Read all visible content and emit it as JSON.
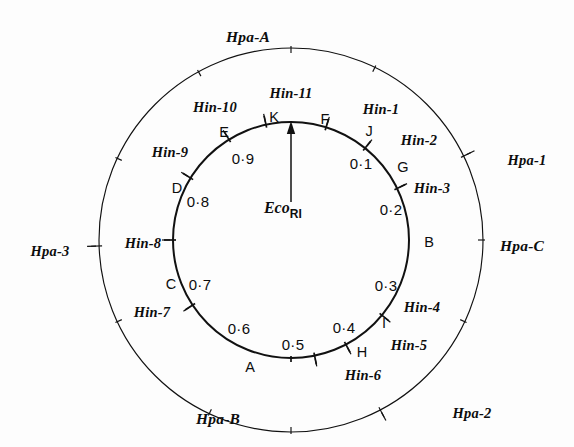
{
  "figure": {
    "origin_label_main": "Eco",
    "origin_label_sub": "RI",
    "origin_label_full": "EcoRI"
  },
  "geometry": {
    "center_x": 291,
    "center_y": 240,
    "inner_radius": 118,
    "outer_radius": 192,
    "stroke_color": "#111111",
    "background": "#fdfdfd"
  },
  "chart_data": {
    "type": "circular-map",
    "units": "fractional map units (0.0 - 1.0, clockwise from EcoRI site at top)",
    "origin": {
      "label": "EcoRI",
      "position": 0.0,
      "marker": "arrow pointing outward to inner circle at top"
    },
    "inner_ring": {
      "name": "Hin (HindII+III) cleavage sites and fragments",
      "sites": [
        {
          "label": "Hin-1",
          "position": 0.048
        },
        {
          "label": "Hin-2",
          "position": 0.108
        },
        {
          "label": "Hin-3",
          "position": 0.178
        },
        {
          "label": "Hin-4",
          "position": 0.36
        },
        {
          "label": "Hin-5",
          "position": 0.423
        },
        {
          "label": "Hin-6",
          "position": 0.468
        },
        {
          "label": "Hin-7",
          "position": 0.657
        },
        {
          "label": "Hin-8",
          "position": 0.75
        },
        {
          "label": "Hin-9",
          "position": 0.838
        },
        {
          "label": "Hin-10",
          "position": 0.912
        },
        {
          "label": "Hin-11",
          "position": 0.966
        }
      ],
      "fragments": [
        {
          "label": "F",
          "position": 0.024
        },
        {
          "label": "J",
          "position": 0.078
        },
        {
          "label": "G",
          "position": 0.143
        },
        {
          "label": "B",
          "position": 0.27
        },
        {
          "label": "I",
          "position": 0.392
        },
        {
          "label": "H",
          "position": 0.446
        },
        {
          "label": "A",
          "position": 0.56
        },
        {
          "label": "C",
          "position": 0.703
        },
        {
          "label": "D",
          "position": 0.794
        },
        {
          "label": "E",
          "position": 0.875
        },
        {
          "label": "K",
          "position": 0.939
        }
      ],
      "coordinate_labels": [
        {
          "label": "0.1",
          "position": 0.1
        },
        {
          "label": "0.2",
          "position": 0.2
        },
        {
          "label": "0.3",
          "position": 0.3
        },
        {
          "label": "0.4",
          "position": 0.4
        },
        {
          "label": "0.5",
          "position": 0.5
        },
        {
          "label": "0.6",
          "position": 0.6
        },
        {
          "label": "0.7",
          "position": 0.7
        },
        {
          "label": "0.8",
          "position": 0.8
        },
        {
          "label": "0.9",
          "position": 0.9
        }
      ]
    },
    "outer_ring": {
      "name": "Hpa (HpaII) cleavage sites and fragments",
      "sites": [
        {
          "label": "Hpa-1",
          "position": 0.178
        },
        {
          "label": "Hpa-2",
          "position": 0.423
        },
        {
          "label": "Hpa-3",
          "position": 0.745
        }
      ],
      "plain_ticks": [
        0.0,
        0.072,
        0.25,
        0.32,
        0.5,
        0.57,
        0.68,
        0.82,
        0.92
      ],
      "fragments": [
        {
          "label": "Hpa-A",
          "position": 0.96
        },
        {
          "label": "Hpa-C",
          "position": 0.25
        },
        {
          "label": "Hpa-2",
          "position": 0.448
        },
        {
          "label": "Hpa-B",
          "position": 0.61
        }
      ]
    }
  },
  "labels": {
    "hin_sites": [
      {
        "name": "hin-1",
        "text": "Hin-1",
        "x": 381,
        "y": 109
      },
      {
        "name": "hin-2",
        "text": "Hin-2",
        "x": 419,
        "y": 140
      },
      {
        "name": "hin-3",
        "text": "Hin-3",
        "x": 432,
        "y": 188
      },
      {
        "name": "hin-4",
        "text": "Hin-4",
        "x": 422,
        "y": 307
      },
      {
        "name": "hin-5",
        "text": "Hin-5",
        "x": 409,
        "y": 345
      },
      {
        "name": "hin-6",
        "text": "Hin-6",
        "x": 363,
        "y": 375
      },
      {
        "name": "hin-7",
        "text": "Hin-7",
        "x": 152,
        "y": 312
      },
      {
        "name": "hin-8",
        "text": "Hin-8",
        "x": 143,
        "y": 243
      },
      {
        "name": "hin-9",
        "text": "Hin-9",
        "x": 170,
        "y": 152
      },
      {
        "name": "hin-10",
        "text": "Hin-10",
        "x": 215,
        "y": 107
      },
      {
        "name": "hin-11",
        "text": "Hin-11",
        "x": 291,
        "y": 93
      }
    ],
    "hpa_sites": [
      {
        "name": "hpa-1",
        "text": "Hpa-1",
        "x": 527,
        "y": 160
      },
      {
        "name": "hpa-2",
        "text": "Hpa-2",
        "x": 472,
        "y": 413
      },
      {
        "name": "hpa-3",
        "text": "Hpa-3",
        "x": 50,
        "y": 251
      }
    ],
    "hpa_regions": [
      {
        "name": "hpa-a",
        "text": "Hpa-A",
        "x": 248,
        "y": 37
      },
      {
        "name": "hpa-c",
        "text": "Hpa-C",
        "x": 522,
        "y": 246
      },
      {
        "name": "hpa-b",
        "text": "Hpa-B",
        "x": 218,
        "y": 419
      }
    ],
    "hin_fragments": [
      {
        "name": "frag-f",
        "text": "F",
        "x": 325,
        "y": 119
      },
      {
        "name": "frag-j",
        "text": "J",
        "x": 369,
        "y": 131
      },
      {
        "name": "frag-g",
        "text": "G",
        "x": 403,
        "y": 167
      },
      {
        "name": "frag-b",
        "text": "B",
        "x": 429,
        "y": 242
      },
      {
        "name": "frag-i",
        "text": "I",
        "x": 384,
        "y": 323
      },
      {
        "name": "frag-h",
        "text": "H",
        "x": 362,
        "y": 352
      },
      {
        "name": "frag-a",
        "text": "A",
        "x": 250,
        "y": 367
      },
      {
        "name": "frag-c",
        "text": "C",
        "x": 171,
        "y": 284
      },
      {
        "name": "frag-d",
        "text": "D",
        "x": 177,
        "y": 188
      },
      {
        "name": "frag-e",
        "text": "E",
        "x": 224,
        "y": 132
      },
      {
        "name": "frag-k",
        "text": "K",
        "x": 274,
        "y": 117
      }
    ],
    "coordinates": [
      {
        "name": "coord-0-1",
        "text": "0·1",
        "x": 361,
        "y": 163
      },
      {
        "name": "coord-0-2",
        "text": "0·2",
        "x": 391,
        "y": 209
      },
      {
        "name": "coord-0-3",
        "text": "0·3",
        "x": 386,
        "y": 285
      },
      {
        "name": "coord-0-4",
        "text": "0·4",
        "x": 344,
        "y": 327
      },
      {
        "name": "coord-0-5",
        "text": "0·5",
        "x": 293,
        "y": 344
      },
      {
        "name": "coord-0-6",
        "text": "0·6",
        "x": 239,
        "y": 328
      },
      {
        "name": "coord-0-7",
        "text": "0·7",
        "x": 200,
        "y": 284
      },
      {
        "name": "coord-0-8",
        "text": "0·8",
        "x": 198,
        "y": 201
      },
      {
        "name": "coord-0-9",
        "text": "0·9",
        "x": 243,
        "y": 158
      }
    ],
    "eco": {
      "name": "ecori",
      "x": 283,
      "y": 210
    }
  }
}
